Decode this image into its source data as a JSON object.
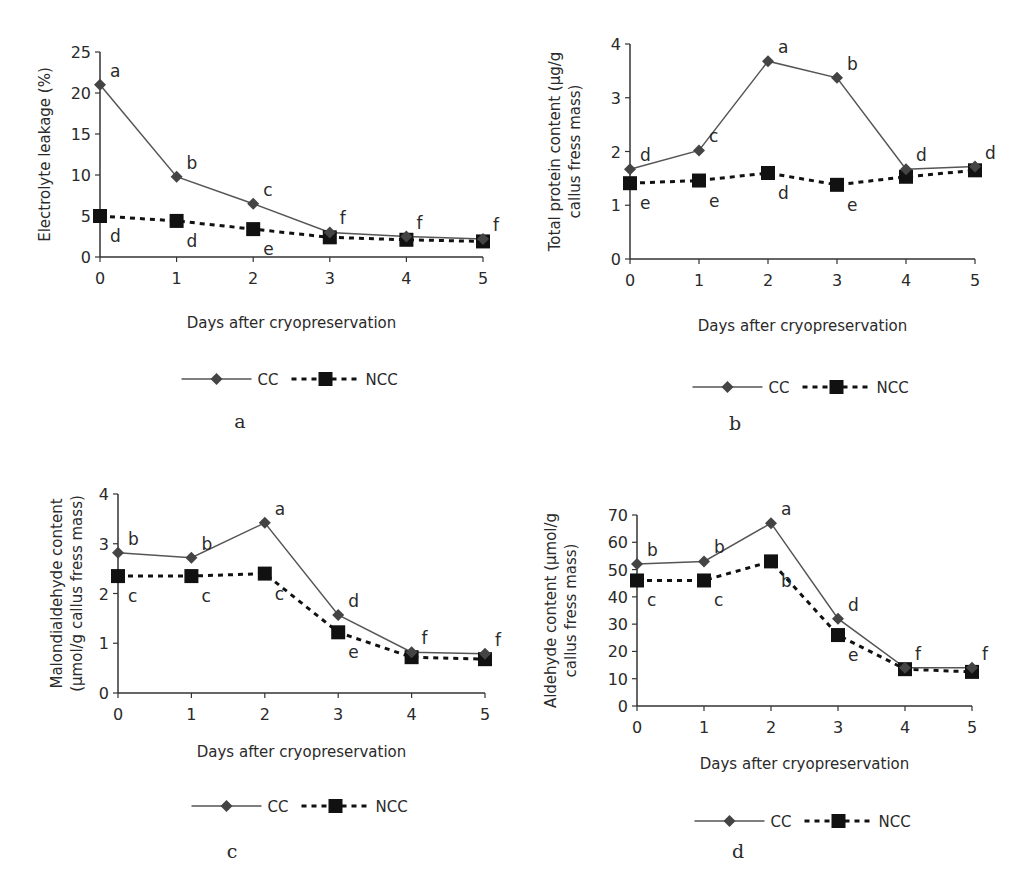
{
  "chart_data": [
    {
      "panel": "a",
      "type": "line",
      "title": "",
      "xlabel": "Days after cryopreservation",
      "ylabel": "Electrolyte leakage (%)",
      "x": [
        0,
        1,
        2,
        3,
        4,
        5
      ],
      "ylim": [
        0,
        25
      ],
      "yticks": [
        0,
        5,
        10,
        15,
        20,
        25
      ],
      "series": [
        {
          "name": "CC",
          "values": [
            21,
            9.8,
            6.5,
            3.0,
            2.5,
            2.2
          ],
          "letters": [
            "a",
            "b",
            "c",
            "f",
            "f",
            "f"
          ]
        },
        {
          "name": "NCC",
          "values": [
            5.0,
            4.4,
            3.4,
            2.4,
            2.1,
            1.9
          ],
          "letters": [
            "d",
            "d",
            "e",
            "",
            "",
            ""
          ]
        }
      ],
      "legend": [
        "CC",
        "NCC"
      ],
      "legend_position": "bottom"
    },
    {
      "panel": "b",
      "type": "line",
      "title": "",
      "xlabel": "Days after cryopreservation",
      "ylabel": "Total protein content (µg/g callus fress mass)",
      "x": [
        0,
        1,
        2,
        3,
        4,
        5
      ],
      "ylim": [
        0,
        4
      ],
      "yticks": [
        0,
        1,
        2,
        3,
        4
      ],
      "series": [
        {
          "name": "CC",
          "values": [
            1.67,
            2.02,
            3.68,
            3.37,
            1.67,
            1.72
          ],
          "letters": [
            "d",
            "c",
            "a",
            "b",
            "d",
            "d"
          ]
        },
        {
          "name": "NCC",
          "values": [
            1.41,
            1.46,
            1.6,
            1.38,
            1.53,
            1.65
          ],
          "letters": [
            "e",
            "e",
            "d",
            "e",
            "",
            ""
          ]
        }
      ],
      "legend": [
        "CC",
        "NCC"
      ],
      "legend_position": "bottom"
    },
    {
      "panel": "c",
      "type": "line",
      "title": "",
      "xlabel": "Days after cryopreservation",
      "ylabel": "Malondialdehyde content (µmol/g callus fress mass)",
      "x": [
        0,
        1,
        2,
        3,
        4,
        5
      ],
      "ylim": [
        0,
        4
      ],
      "yticks": [
        0,
        1,
        2,
        3,
        4
      ],
      "series": [
        {
          "name": "CC",
          "values": [
            2.82,
            2.72,
            3.42,
            1.57,
            0.82,
            0.79
          ],
          "letters": [
            "b",
            "b",
            "a",
            "d",
            "f",
            "f"
          ]
        },
        {
          "name": "NCC",
          "values": [
            2.35,
            2.35,
            2.4,
            1.22,
            0.72,
            0.68
          ],
          "letters": [
            "c",
            "c",
            "c",
            "e",
            "",
            ""
          ]
        }
      ],
      "legend": [
        "CC",
        "NCC"
      ],
      "legend_position": "bottom"
    },
    {
      "panel": "d",
      "type": "line",
      "title": "",
      "xlabel": "Days after cryopreservation",
      "ylabel": "Aldehyde content (µmol/g callus fress mass)",
      "x": [
        0,
        1,
        2,
        3,
        4,
        5
      ],
      "ylim": [
        0,
        70
      ],
      "yticks": [
        0,
        10,
        20,
        30,
        40,
        50,
        60,
        70
      ],
      "series": [
        {
          "name": "CC",
          "values": [
            52,
            53,
            67,
            32,
            14,
            14
          ],
          "letters": [
            "b",
            "b",
            "a",
            "d",
            "f",
            "f"
          ]
        },
        {
          "name": "NCC",
          "values": [
            46,
            46,
            53,
            26,
            13.5,
            12.5
          ],
          "letters": [
            "c",
            "c",
            "b",
            "e",
            "",
            ""
          ]
        }
      ],
      "legend": [
        "CC",
        "NCC"
      ],
      "legend_position": "bottom"
    }
  ],
  "panels": {
    "a": {
      "letter": "a",
      "ylabel_lines": [
        "Electrolyte leakage (%)"
      ],
      "xlabel": "Days after cryopreservation",
      "legend_cc": "CC",
      "legend_ncc": "NCC"
    },
    "b": {
      "letter": "b",
      "ylabel_lines": [
        "Total protein content (µg/g",
        "callus fress mass)"
      ],
      "xlabel": "Days after cryopreservation",
      "legend_cc": "CC",
      "legend_ncc": "NCC"
    },
    "c": {
      "letter": "c",
      "ylabel_lines": [
        "Malondialdehyde content",
        "(µmol/g callus fress mass)"
      ],
      "xlabel": "Days after cryopreservation",
      "legend_cc": "CC",
      "legend_ncc": "NCC"
    },
    "d": {
      "letter": "d",
      "ylabel_lines": [
        "Aldehyde content  (µmol/g",
        "callus fress mass)"
      ],
      "xlabel": "Days after cryopreservation",
      "legend_cc": "CC",
      "legend_ncc": "NCC"
    }
  },
  "colors": {
    "cc_line": "#555555",
    "cc_marker": "#444444",
    "ncc": "#111111",
    "axis": "#333333",
    "text": "#2a2a2a"
  }
}
